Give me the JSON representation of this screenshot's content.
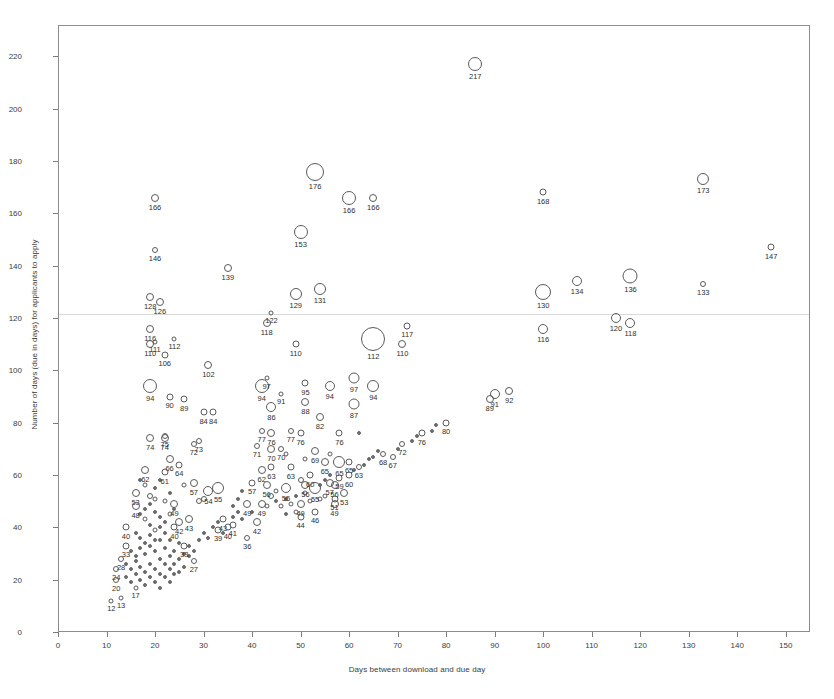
{
  "chart_data": {
    "type": "scatter",
    "title": "",
    "xlabel": "Days between download and due day",
    "ylabel": "Number of days (due in days) for applicants to apply",
    "xlim": [
      0,
      155
    ],
    "ylim": [
      0,
      232
    ],
    "xticks": [
      0,
      10,
      20,
      30,
      40,
      50,
      60,
      70,
      80,
      90,
      100,
      110,
      120,
      130,
      140,
      150
    ],
    "yticks": [
      0,
      20,
      40,
      60,
      80,
      100,
      120,
      140,
      160,
      180,
      200,
      220
    ],
    "grid": "single faint horizontal line near y=122",
    "gridlines_y": [
      122
    ],
    "legend": "none",
    "marker": "open circle, size proportional to count",
    "points": [
      {
        "x": 86,
        "y": 217,
        "label": "217",
        "r": 7
      },
      {
        "x": 53,
        "y": 176,
        "label": "176",
        "r": 9
      },
      {
        "x": 20,
        "y": 166,
        "label": "166",
        "r": 4
      },
      {
        "x": 60,
        "y": 166,
        "label": "166",
        "r": 7
      },
      {
        "x": 65,
        "y": 166,
        "label": "166",
        "r": 4
      },
      {
        "x": 100,
        "y": 168,
        "label": "168",
        "r": 3.5
      },
      {
        "x": 133,
        "y": 173,
        "label": "173",
        "r": 6
      },
      {
        "x": 50,
        "y": 153,
        "label": "153",
        "r": 7
      },
      {
        "x": 20,
        "y": 146,
        "label": "146",
        "r": 3
      },
      {
        "x": 147,
        "y": 147,
        "label": "147",
        "r": 3.5
      },
      {
        "x": 35,
        "y": 139,
        "label": "139",
        "r": 4
      },
      {
        "x": 107,
        "y": 134,
        "label": "134",
        "r": 5
      },
      {
        "x": 118,
        "y": 136,
        "label": "136",
        "r": 7.5
      },
      {
        "x": 133,
        "y": 133,
        "label": "133",
        "r": 3
      },
      {
        "x": 100,
        "y": 130,
        "label": "130",
        "r": 8
      },
      {
        "x": 19,
        "y": 128,
        "label": "128",
        "r": 4
      },
      {
        "x": 21,
        "y": 126,
        "label": "126",
        "r": 4
      },
      {
        "x": 49,
        "y": 129,
        "label": "129",
        "r": 6
      },
      {
        "x": 54,
        "y": 131,
        "label": "131",
        "r": 6
      },
      {
        "x": 44,
        "y": 122,
        "label": "122",
        "r": 2.5
      },
      {
        "x": 43,
        "y": 118,
        "label": "118",
        "r": 4
      },
      {
        "x": 100,
        "y": 116,
        "label": "116",
        "r": 5
      },
      {
        "x": 19,
        "y": 116,
        "label": "116",
        "r": 4
      },
      {
        "x": 115,
        "y": 120,
        "label": "120",
        "r": 5
      },
      {
        "x": 118,
        "y": 118,
        "label": "118",
        "r": 5
      },
      {
        "x": 24,
        "y": 112,
        "label": "112",
        "r": 2.5
      },
      {
        "x": 65,
        "y": 112,
        "label": "112",
        "r": 12
      },
      {
        "x": 20,
        "y": 111,
        "label": "111",
        "r": 2.5
      },
      {
        "x": 19,
        "y": 110,
        "label": "110",
        "r": 4
      },
      {
        "x": 49,
        "y": 110,
        "label": "110",
        "r": 3.5
      },
      {
        "x": 71,
        "y": 110,
        "label": "110",
        "r": 4
      },
      {
        "x": 72,
        "y": 117,
        "label": "117",
        "r": 3.5
      },
      {
        "x": 22,
        "y": 106,
        "label": "106",
        "r": 3.5
      },
      {
        "x": 31,
        "y": 102,
        "label": "102",
        "r": 4
      },
      {
        "x": 19,
        "y": 94,
        "label": "94",
        "r": 7
      },
      {
        "x": 42,
        "y": 94,
        "label": "94",
        "r": 7
      },
      {
        "x": 56,
        "y": 94,
        "label": "94",
        "r": 5
      },
      {
        "x": 65,
        "y": 94,
        "label": "94",
        "r": 6
      },
      {
        "x": 43,
        "y": 97,
        "label": "97",
        "r": 2.5
      },
      {
        "x": 61,
        "y": 97,
        "label": "97",
        "r": 5.5
      },
      {
        "x": 46,
        "y": 91,
        "label": "91",
        "r": 2.5
      },
      {
        "x": 51,
        "y": 95,
        "label": "95",
        "r": 3.5
      },
      {
        "x": 90,
        "y": 91,
        "label": "91",
        "r": 5
      },
      {
        "x": 93,
        "y": 92,
        "label": "92",
        "r": 4
      },
      {
        "x": 89,
        "y": 89,
        "label": "89",
        "r": 4
      },
      {
        "x": 23,
        "y": 90,
        "label": "90",
        "r": 3.5
      },
      {
        "x": 26,
        "y": 89,
        "label": "89",
        "r": 3.5
      },
      {
        "x": 44,
        "y": 86,
        "label": "86",
        "r": 5
      },
      {
        "x": 51,
        "y": 88,
        "label": "88",
        "r": 4
      },
      {
        "x": 61,
        "y": 87,
        "label": "87",
        "r": 5.5
      },
      {
        "x": 54,
        "y": 82,
        "label": "82",
        "r": 4
      },
      {
        "x": 30,
        "y": 84,
        "label": "84",
        "r": 3.5
      },
      {
        "x": 32,
        "y": 84,
        "label": "84",
        "r": 3.5
      },
      {
        "x": 80,
        "y": 80,
        "label": "80",
        "r": 3.5
      },
      {
        "x": 22,
        "y": 75,
        "label": "75",
        "r": 3
      },
      {
        "x": 19,
        "y": 74,
        "label": "74",
        "r": 4
      },
      {
        "x": 22,
        "y": 74,
        "label": "74",
        "r": 4
      },
      {
        "x": 29,
        "y": 73,
        "label": "73",
        "r": 3
      },
      {
        "x": 28,
        "y": 72,
        "label": "72",
        "r": 3
      },
      {
        "x": 42,
        "y": 77,
        "label": "77",
        "r": 3
      },
      {
        "x": 44,
        "y": 76,
        "label": "76",
        "r": 4
      },
      {
        "x": 48,
        "y": 77,
        "label": "77",
        "r": 3
      },
      {
        "x": 50,
        "y": 76,
        "label": "76",
        "r": 3.5
      },
      {
        "x": 58,
        "y": 76,
        "label": "76",
        "r": 3.5
      },
      {
        "x": 75,
        "y": 76,
        "label": "76",
        "r": 3.5
      },
      {
        "x": 71,
        "y": 72,
        "label": "72",
        "r": 3
      },
      {
        "x": 41,
        "y": 71,
        "label": "71",
        "r": 3
      },
      {
        "x": 44,
        "y": 70,
        "label": "70",
        "r": 4
      },
      {
        "x": 46,
        "y": 70,
        "label": "70",
        "r": 3
      },
      {
        "x": 67,
        "y": 68,
        "label": "68",
        "r": 3
      },
      {
        "x": 69,
        "y": 67,
        "label": "67",
        "r": 3
      },
      {
        "x": 53,
        "y": 69,
        "label": "69",
        "r": 4
      },
      {
        "x": 55,
        "y": 65,
        "label": "65",
        "r": 4
      },
      {
        "x": 58,
        "y": 65,
        "label": "65",
        "r": 6
      },
      {
        "x": 60,
        "y": 65,
        "label": "65",
        "r": 3.5
      },
      {
        "x": 23,
        "y": 66,
        "label": "66",
        "r": 4
      },
      {
        "x": 25,
        "y": 64,
        "label": "64",
        "r": 3.5
      },
      {
        "x": 44,
        "y": 63,
        "label": "63",
        "r": 3.5
      },
      {
        "x": 48,
        "y": 63,
        "label": "63",
        "r": 3.5
      },
      {
        "x": 62,
        "y": 63,
        "label": "63",
        "r": 3
      },
      {
        "x": 18,
        "y": 62,
        "label": "62",
        "r": 4
      },
      {
        "x": 42,
        "y": 62,
        "label": "62",
        "r": 4
      },
      {
        "x": 43,
        "y": 56,
        "label": "56",
        "r": 4
      },
      {
        "x": 51,
        "y": 56,
        "label": "56",
        "r": 4
      },
      {
        "x": 57,
        "y": 56,
        "label": "56",
        "r": 4
      },
      {
        "x": 22,
        "y": 61,
        "label": "61",
        "r": 3.5
      },
      {
        "x": 28,
        "y": 57,
        "label": "57",
        "r": 4
      },
      {
        "x": 40,
        "y": 57,
        "label": "57",
        "r": 3.5
      },
      {
        "x": 56,
        "y": 57,
        "label": "57",
        "r": 4
      },
      {
        "x": 33,
        "y": 55,
        "label": "55",
        "r": 6
      },
      {
        "x": 47,
        "y": 55,
        "label": "55",
        "r": 5
      },
      {
        "x": 53,
        "y": 55,
        "label": "55",
        "r": 6
      },
      {
        "x": 31,
        "y": 54,
        "label": "54",
        "r": 5
      },
      {
        "x": 16,
        "y": 53,
        "label": "53",
        "r": 4
      },
      {
        "x": 59,
        "y": 53,
        "label": "53",
        "r": 4
      },
      {
        "x": 58,
        "y": 59,
        "label": "59",
        "r": 3.5
      },
      {
        "x": 60,
        "y": 60,
        "label": "60",
        "r": 3.5
      },
      {
        "x": 52,
        "y": 60,
        "label": "60",
        "r": 3.5
      },
      {
        "x": 16,
        "y": 48,
        "label": "48",
        "r": 4
      },
      {
        "x": 24,
        "y": 49,
        "label": "49",
        "r": 4
      },
      {
        "x": 39,
        "y": 49,
        "label": "49",
        "r": 4
      },
      {
        "x": 42,
        "y": 49,
        "label": "49",
        "r": 4
      },
      {
        "x": 50,
        "y": 49,
        "label": "49",
        "r": 4
      },
      {
        "x": 57,
        "y": 49,
        "label": "49",
        "r": 4
      },
      {
        "x": 57,
        "y": 51,
        "label": "51",
        "r": 3.5
      },
      {
        "x": 27,
        "y": 43,
        "label": "43",
        "r": 4
      },
      {
        "x": 34,
        "y": 43,
        "label": "43",
        "r": 3.5
      },
      {
        "x": 25,
        "y": 42,
        "label": "42",
        "r": 4
      },
      {
        "x": 41,
        "y": 42,
        "label": "42",
        "r": 4
      },
      {
        "x": 36,
        "y": 41,
        "label": "41",
        "r": 3.5
      },
      {
        "x": 35,
        "y": 40,
        "label": "40",
        "r": 3.5
      },
      {
        "x": 14,
        "y": 40,
        "label": "40",
        "r": 3.5
      },
      {
        "x": 24,
        "y": 40,
        "label": "40",
        "r": 3.5
      },
      {
        "x": 33,
        "y": 39,
        "label": "39",
        "r": 3.5
      },
      {
        "x": 50,
        "y": 44,
        "label": "44",
        "r": 3.5
      },
      {
        "x": 53,
        "y": 46,
        "label": "46",
        "r": 3.5
      },
      {
        "x": 39,
        "y": 36,
        "label": "36",
        "r": 3
      },
      {
        "x": 14,
        "y": 33,
        "label": "33",
        "r": 3.5
      },
      {
        "x": 26,
        "y": 33,
        "label": "33",
        "r": 3.5
      },
      {
        "x": 28,
        "y": 27,
        "label": "27",
        "r": 3
      },
      {
        "x": 13,
        "y": 28,
        "label": "28",
        "r": 3
      },
      {
        "x": 12,
        "y": 24,
        "label": "24",
        "r": 3
      },
      {
        "x": 12,
        "y": 20,
        "label": "20",
        "r": 3
      },
      {
        "x": 13,
        "y": 13,
        "label": "13",
        "r": 2.5
      },
      {
        "x": 16,
        "y": 17,
        "label": "17",
        "r": 2.5
      },
      {
        "x": 11,
        "y": 12,
        "label": "12",
        "r": 2.5
      }
    ],
    "unlabeled_points": [
      {
        "x": 17,
        "y": 58,
        "r": 2
      },
      {
        "x": 18,
        "y": 56,
        "r": 2.5
      },
      {
        "x": 19,
        "y": 52,
        "r": 3
      },
      {
        "x": 19,
        "y": 49,
        "r": 2
      },
      {
        "x": 20,
        "y": 55,
        "r": 2
      },
      {
        "x": 21,
        "y": 58,
        "r": 2
      },
      {
        "x": 17,
        "y": 45,
        "r": 2
      },
      {
        "x": 18,
        "y": 43,
        "r": 2.5
      },
      {
        "x": 19,
        "y": 41,
        "r": 2
      },
      {
        "x": 20,
        "y": 46,
        "r": 2
      },
      {
        "x": 21,
        "y": 44,
        "r": 2
      },
      {
        "x": 22,
        "y": 50,
        "r": 2.5
      },
      {
        "x": 16,
        "y": 38,
        "r": 2
      },
      {
        "x": 17,
        "y": 36,
        "r": 2
      },
      {
        "x": 18,
        "y": 34,
        "r": 2
      },
      {
        "x": 19,
        "y": 37,
        "r": 2
      },
      {
        "x": 20,
        "y": 39,
        "r": 2.5
      },
      {
        "x": 21,
        "y": 35,
        "r": 2
      },
      {
        "x": 22,
        "y": 38,
        "r": 2
      },
      {
        "x": 23,
        "y": 45,
        "r": 2.5
      },
      {
        "x": 24,
        "y": 47,
        "r": 2
      },
      {
        "x": 15,
        "y": 31,
        "r": 2
      },
      {
        "x": 16,
        "y": 29,
        "r": 2
      },
      {
        "x": 17,
        "y": 32,
        "r": 2
      },
      {
        "x": 18,
        "y": 30,
        "r": 2
      },
      {
        "x": 19,
        "y": 33,
        "r": 2
      },
      {
        "x": 20,
        "y": 31,
        "r": 2
      },
      {
        "x": 21,
        "y": 28,
        "r": 2
      },
      {
        "x": 22,
        "y": 32,
        "r": 2
      },
      {
        "x": 23,
        "y": 35,
        "r": 2
      },
      {
        "x": 14,
        "y": 26,
        "r": 2
      },
      {
        "x": 15,
        "y": 24,
        "r": 2
      },
      {
        "x": 16,
        "y": 27,
        "r": 2
      },
      {
        "x": 17,
        "y": 25,
        "r": 2
      },
      {
        "x": 18,
        "y": 23,
        "r": 2
      },
      {
        "x": 19,
        "y": 26,
        "r": 2
      },
      {
        "x": 20,
        "y": 24,
        "r": 2
      },
      {
        "x": 21,
        "y": 22,
        "r": 2
      },
      {
        "x": 22,
        "y": 26,
        "r": 2
      },
      {
        "x": 23,
        "y": 29,
        "r": 2
      },
      {
        "x": 24,
        "y": 31,
        "r": 2
      },
      {
        "x": 25,
        "y": 34,
        "r": 2
      },
      {
        "x": 14,
        "y": 21,
        "r": 2
      },
      {
        "x": 15,
        "y": 19,
        "r": 2
      },
      {
        "x": 16,
        "y": 22,
        "r": 2
      },
      {
        "x": 17,
        "y": 20,
        "r": 2
      },
      {
        "x": 18,
        "y": 18,
        "r": 2
      },
      {
        "x": 19,
        "y": 21,
        "r": 2
      },
      {
        "x": 20,
        "y": 19,
        "r": 2
      },
      {
        "x": 21,
        "y": 17,
        "r": 2
      },
      {
        "x": 22,
        "y": 21,
        "r": 2
      },
      {
        "x": 23,
        "y": 24,
        "r": 2
      },
      {
        "x": 24,
        "y": 26,
        "r": 2
      },
      {
        "x": 26,
        "y": 30,
        "r": 2
      },
      {
        "x": 27,
        "y": 33,
        "r": 2
      },
      {
        "x": 28,
        "y": 31,
        "r": 2
      },
      {
        "x": 29,
        "y": 35,
        "r": 2
      },
      {
        "x": 30,
        "y": 38,
        "r": 2
      },
      {
        "x": 31,
        "y": 36,
        "r": 2
      },
      {
        "x": 32,
        "y": 40,
        "r": 2
      },
      {
        "x": 33,
        "y": 42,
        "r": 2
      },
      {
        "x": 34,
        "y": 38,
        "r": 2
      },
      {
        "x": 36,
        "y": 44,
        "r": 2
      },
      {
        "x": 37,
        "y": 46,
        "r": 2
      },
      {
        "x": 38,
        "y": 43,
        "r": 2
      },
      {
        "x": 40,
        "y": 46,
        "r": 2
      },
      {
        "x": 43,
        "y": 48,
        "r": 2.5
      },
      {
        "x": 45,
        "y": 50,
        "r": 2
      },
      {
        "x": 46,
        "y": 48,
        "r": 2.5
      },
      {
        "x": 47,
        "y": 51,
        "r": 2
      },
      {
        "x": 48,
        "y": 49,
        "r": 2.5
      },
      {
        "x": 49,
        "y": 52,
        "r": 2
      },
      {
        "x": 51,
        "y": 53,
        "r": 2.5
      },
      {
        "x": 54,
        "y": 56,
        "r": 2
      },
      {
        "x": 55,
        "y": 58,
        "r": 2
      },
      {
        "x": 56,
        "y": 60,
        "r": 2
      },
      {
        "x": 61,
        "y": 62,
        "r": 2
      },
      {
        "x": 63,
        "y": 64,
        "r": 2
      },
      {
        "x": 64,
        "y": 66,
        "r": 2
      },
      {
        "x": 65,
        "y": 67,
        "r": 2
      },
      {
        "x": 66,
        "y": 69,
        "r": 2
      },
      {
        "x": 70,
        "y": 70,
        "r": 2
      },
      {
        "x": 73,
        "y": 73,
        "r": 2
      },
      {
        "x": 74,
        "y": 75,
        "r": 2
      },
      {
        "x": 77,
        "y": 77,
        "r": 2
      },
      {
        "x": 78,
        "y": 79,
        "r": 2
      },
      {
        "x": 26,
        "y": 25,
        "r": 2
      },
      {
        "x": 25,
        "y": 28,
        "r": 2
      },
      {
        "x": 24,
        "y": 22,
        "r": 2
      },
      {
        "x": 23,
        "y": 19,
        "r": 2
      },
      {
        "x": 25,
        "y": 23,
        "r": 2
      },
      {
        "x": 27,
        "y": 29,
        "r": 2
      },
      {
        "x": 20,
        "y": 35,
        "r": 2
      },
      {
        "x": 21,
        "y": 40,
        "r": 2
      },
      {
        "x": 22,
        "y": 42,
        "r": 2
      },
      {
        "x": 18,
        "y": 47,
        "r": 2
      },
      {
        "x": 20,
        "y": 51,
        "r": 2.5
      },
      {
        "x": 23,
        "y": 53,
        "r": 2
      },
      {
        "x": 26,
        "y": 56,
        "r": 2.5
      },
      {
        "x": 29,
        "y": 50,
        "r": 3
      },
      {
        "x": 30,
        "y": 51,
        "r": 3
      },
      {
        "x": 37,
        "y": 51,
        "r": 2
      },
      {
        "x": 38,
        "y": 54,
        "r": 2
      },
      {
        "x": 36,
        "y": 48,
        "r": 2
      },
      {
        "x": 44,
        "y": 52,
        "r": 3
      },
      {
        "x": 45,
        "y": 54,
        "r": 2.5
      },
      {
        "x": 47,
        "y": 45,
        "r": 2
      },
      {
        "x": 49,
        "y": 46,
        "r": 2.5
      },
      {
        "x": 52,
        "y": 50,
        "r": 2.5
      },
      {
        "x": 54,
        "y": 51,
        "r": 2.5
      },
      {
        "x": 55,
        "y": 52,
        "r": 2.5
      },
      {
        "x": 50,
        "y": 58,
        "r": 3
      },
      {
        "x": 56,
        "y": 68,
        "r": 2.5
      },
      {
        "x": 51,
        "y": 66,
        "r": 2.5
      },
      {
        "x": 62,
        "y": 76,
        "r": 2
      },
      {
        "x": 47,
        "y": 68,
        "r": 2.5
      }
    ]
  }
}
